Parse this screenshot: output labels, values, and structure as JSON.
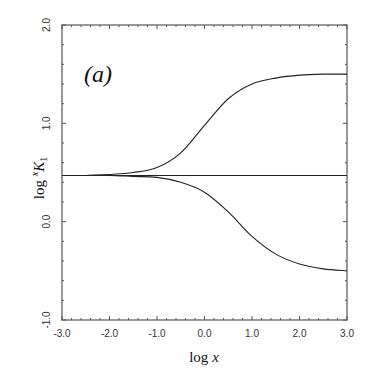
{
  "chart_data": {
    "type": "line",
    "title": "",
    "panel_label": "(a)",
    "xlabel": "log x",
    "ylabel": "log xK1",
    "ylabel_parts": {
      "prefix": "log ",
      "superscript": "x",
      "main": "K",
      "subscript": "1"
    },
    "xlim": [
      -3.0,
      3.0
    ],
    "ylim": [
      -1.0,
      2.0
    ],
    "x_ticks": [
      -3.0,
      -2.0,
      -1.0,
      0.0,
      1.0,
      2.0,
      3.0
    ],
    "x_tick_labels": [
      "-3.0",
      "-2.0",
      "-1.0",
      "0.0",
      "1.0",
      "2.0",
      "3.0"
    ],
    "y_ticks": [
      -1.0,
      0.0,
      1.0,
      2.0
    ],
    "y_tick_labels": [
      "-1.0",
      "0.0",
      "1.0",
      "2.0"
    ],
    "grid": false,
    "legend": null,
    "x": [
      -3.0,
      -2.5,
      -2.0,
      -1.5,
      -1.0,
      -0.5,
      0.0,
      0.5,
      1.0,
      1.5,
      2.0,
      2.5,
      3.0
    ],
    "series": [
      {
        "name": "upper",
        "values": [
          0.47,
          0.47,
          0.48,
          0.5,
          0.55,
          0.7,
          0.98,
          1.25,
          1.4,
          1.46,
          1.49,
          1.5,
          1.5
        ]
      },
      {
        "name": "constant",
        "values": [
          0.47,
          0.47,
          0.47,
          0.47,
          0.47,
          0.47,
          0.47,
          0.47,
          0.47,
          0.47,
          0.47,
          0.47,
          0.47
        ]
      },
      {
        "name": "lower",
        "values": [
          0.47,
          0.47,
          0.47,
          0.46,
          0.45,
          0.4,
          0.3,
          0.1,
          -0.15,
          -0.33,
          -0.43,
          -0.48,
          -0.5
        ]
      }
    ]
  }
}
